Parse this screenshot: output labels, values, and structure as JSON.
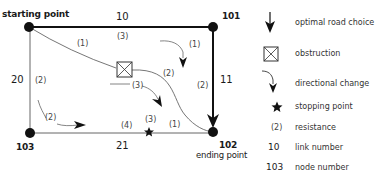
{
  "diagram": {
    "nodes": [
      {
        "id": "start",
        "label": "starting point",
        "number": ""
      },
      {
        "id": "101",
        "number": "101"
      },
      {
        "id": "103",
        "number": "103"
      },
      {
        "id": "102",
        "number": "102",
        "label": "ending point"
      }
    ],
    "links": [
      {
        "number": "10",
        "from": "start",
        "to": "101",
        "resistance": "(3)"
      },
      {
        "number": "11",
        "from": "101",
        "to": "102",
        "resistance": "(2)"
      },
      {
        "number": "20",
        "from": "start",
        "to": "103",
        "resistance": "(2)"
      },
      {
        "number": "21",
        "from": "103",
        "to": "102",
        "resistance": "(4)"
      }
    ],
    "other_resistances": [
      {
        "label": "(1)",
        "where": "diagonal from start to obstruction"
      },
      {
        "label": "(2)",
        "where": "curve from obstruction to 102"
      },
      {
        "label": "(3)",
        "where": "directional change below obstruction"
      },
      {
        "label": "(1)",
        "where": "directional change near 101"
      },
      {
        "label": "(2)",
        "where": "directional change near 103"
      },
      {
        "label": "(3)",
        "where": "above stopping point"
      },
      {
        "label": "(1)",
        "where": "link 21 between stopping point and 102"
      }
    ],
    "legend": [
      {
        "icon": "optimal-road-arrow-icon",
        "key": "",
        "text": "optimal road choice"
      },
      {
        "icon": "obstruction-icon",
        "key": "",
        "text": "obstruction"
      },
      {
        "icon": "directional-change-icon",
        "key": "",
        "text": "directional change"
      },
      {
        "icon": "star-icon",
        "key": "★",
        "text": "stopping point"
      },
      {
        "icon": "",
        "key": "(2)",
        "text": "resistance"
      },
      {
        "icon": "",
        "key": "10",
        "text": "link number"
      },
      {
        "icon": "",
        "key": "103",
        "text": "node number"
      }
    ]
  }
}
